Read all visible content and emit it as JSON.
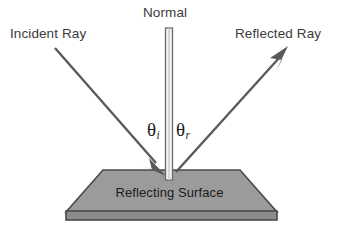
{
  "diagram": {
    "background_color": "#ffffff",
    "labels": {
      "incident_ray": "Incident Ray",
      "normal": "Normal",
      "reflected_ray": "Reflected Ray",
      "reflecting_surface": "Reflecting Surface"
    },
    "angles": {
      "incidence_symbol": "θ",
      "incidence_subscript": "i",
      "reflection_symbol": "θ",
      "reflection_subscript": "r"
    },
    "colors": {
      "ray_stroke": "#5a5a5a",
      "text_dark": "#1b1b1b",
      "text_gray": "#3b3b3b",
      "surface_fill": "#9b9b9b",
      "surface_stroke": "#4a4a4a",
      "surface_base_fill": "#8c8c8c",
      "normal_fill": "#f2f2f2",
      "normal_stroke": "#6a6a6a"
    },
    "geometry": {
      "incident_ray": {
        "x1": 55,
        "y1": 48,
        "x2": 163,
        "y2": 172
      },
      "reflected_ray": {
        "x1": 176,
        "y1": 172,
        "x2": 286,
        "y2": 50
      },
      "normal_line": {
        "x": 169,
        "y_top": 28,
        "y_bottom": 180,
        "width": 7
      },
      "surface_top_left": {
        "x": 103,
        "y": 170
      },
      "surface_top_right": {
        "x": 240,
        "y": 170
      },
      "surface_bottom_left": {
        "x": 66,
        "y": 212
      },
      "surface_bottom_right": {
        "x": 277,
        "y": 212
      },
      "base_strip": {
        "x": 66,
        "y": 212,
        "width": 211,
        "height": 8
      }
    }
  }
}
